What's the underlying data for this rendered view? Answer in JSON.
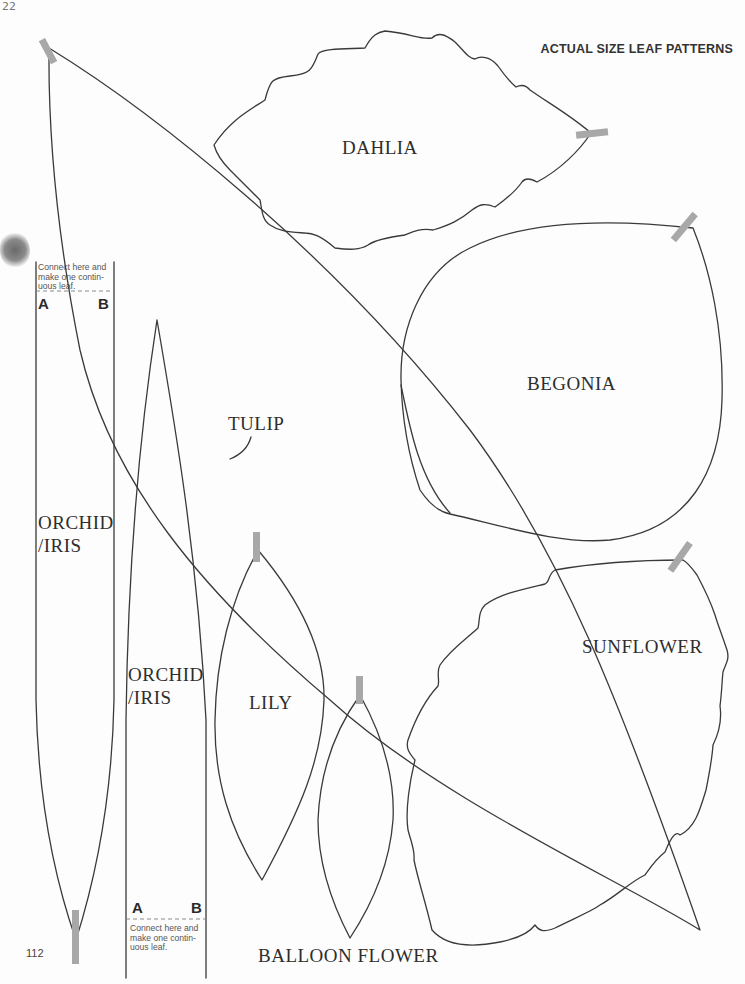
{
  "page": {
    "header": "ACTUAL SIZE LEAF PATTERNS",
    "page_number": "112",
    "handwritten_mark": "22"
  },
  "patterns": {
    "dahlia": "DAHLIA",
    "begonia": "BEGONIA",
    "tulip": "TULIP",
    "sunflower": "SUNFLOWER",
    "lily": "LILY",
    "balloon_flower": "BALLOON FLOWER",
    "orchid_iris_a_line1": "ORCHID",
    "orchid_iris_a_line2": "/IRIS",
    "orchid_iris_b_line1": "ORCHID",
    "orchid_iris_b_line2": "/IRIS"
  },
  "connectors": {
    "top": {
      "note_line1": "Connect here and",
      "note_line2": "make one contin-",
      "note_line3": "uous leaf.",
      "label_a": "A",
      "label_b": "B"
    },
    "bottom": {
      "note_line1": "Connect here and",
      "note_line2": "make one contin-",
      "note_line3": "uous leaf.",
      "label_a": "A",
      "label_b": "B"
    }
  },
  "colors": {
    "outline": "#3a3a3a",
    "tape_tab": "#a8a8a8",
    "paper": "#fdfdfd"
  }
}
